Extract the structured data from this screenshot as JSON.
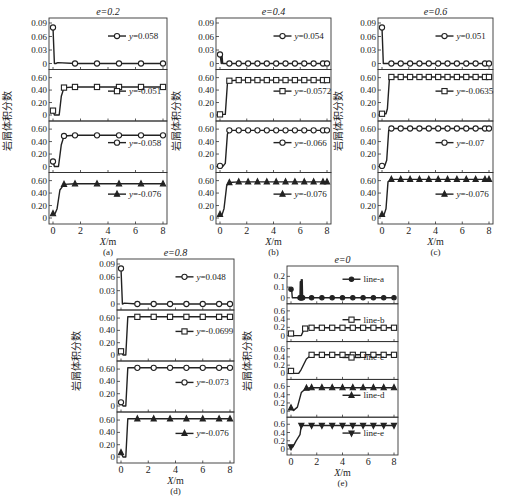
{
  "figure": {
    "ylabel": "岩屑体积分数",
    "xlabel": "X/m"
  },
  "chart_data": [
    {
      "id": "a",
      "type": "line",
      "caption": "(a)",
      "title": "e=0.2",
      "xlabel": "X/m",
      "ylabel": "岩屑体积分数",
      "xticks": [
        0,
        2,
        4,
        6,
        8
      ],
      "xlim": [
        0,
        8
      ],
      "subplots": [
        {
          "legend": "y=0.058",
          "marker": "circle",
          "yticks": [
            "0",
            "0.03",
            "0.06",
            "0.09"
          ],
          "ylim": [
            0,
            0.09
          ],
          "x": [
            0,
            0.1,
            0.2,
            0.35,
            1.6,
            3.2,
            4.8,
            6.4,
            8
          ],
          "y": [
            0.08,
            0.0,
            0.0,
            0.002,
            0.0,
            0.0,
            0.0,
            0.0,
            0.0
          ]
        },
        {
          "legend": "y=-0.051",
          "marker": "square",
          "yticks": [
            "0",
            "0.20",
            "0.40",
            "0.60"
          ],
          "ylim": [
            0,
            0.65
          ],
          "x": [
            0,
            0.1,
            0.45,
            0.6,
            0.8,
            1.6,
            3.2,
            4.8,
            6.4,
            8
          ],
          "y": [
            0.07,
            0.0,
            0.0,
            0.3,
            0.44,
            0.45,
            0.45,
            0.45,
            0.45,
            0.45
          ]
        },
        {
          "legend": "y=-0.058",
          "marker": "circle",
          "yticks": [
            "0",
            "0.20",
            "0.40",
            "0.60"
          ],
          "ylim": [
            0,
            0.65
          ],
          "x": [
            0,
            0.1,
            0.4,
            0.6,
            0.8,
            1.6,
            3.2,
            4.8,
            6.4,
            8
          ],
          "y": [
            0.08,
            0.0,
            0.0,
            0.35,
            0.49,
            0.5,
            0.5,
            0.5,
            0.5,
            0.5
          ]
        },
        {
          "legend": "y=-0.076",
          "marker": "triangle",
          "yticks": [
            "0",
            "0.20",
            "0.40",
            "0.60"
          ],
          "ylim": [
            0,
            0.65
          ],
          "x": [
            0,
            0.15,
            0.3,
            0.5,
            0.8,
            1.6,
            3.2,
            4.8,
            6.4,
            8
          ],
          "y": [
            0.07,
            0.07,
            0.15,
            0.45,
            0.54,
            0.55,
            0.55,
            0.55,
            0.55,
            0.55
          ]
        }
      ]
    },
    {
      "id": "b",
      "type": "line",
      "caption": "(b)",
      "title": "e=0.4",
      "xlabel": "X/m",
      "ylabel": "岩屑体积分数",
      "xticks": [
        0,
        2,
        4,
        6,
        8
      ],
      "xlim": [
        0,
        8
      ],
      "subplots": [
        {
          "legend": "y=0.054",
          "marker": "circle",
          "yticks": [
            "0",
            "0.03",
            "0.06",
            "0.09"
          ],
          "ylim": [
            0,
            0.09
          ],
          "x": [
            0,
            0.1,
            0.15,
            0.2,
            0.25,
            0.7,
            1.4,
            2.1,
            2.8,
            3.5,
            4.2,
            4.9,
            5.6,
            6.3,
            7,
            7.7,
            8
          ],
          "y": [
            0.02,
            0.0,
            0.018,
            0.0,
            0.0,
            0.0,
            0.0,
            0.0,
            0.0,
            0.0,
            0.0,
            0.0,
            0.0,
            0.0,
            0.0,
            0.0,
            0.0
          ]
        },
        {
          "legend": "y=-0.0572",
          "marker": "square",
          "yticks": [
            "0",
            "0.20",
            "0.40",
            "0.60"
          ],
          "ylim": [
            0,
            0.65
          ],
          "x": [
            0,
            0.4,
            0.55,
            0.7,
            1.4,
            2.1,
            2.8,
            3.5,
            4.2,
            4.9,
            5.6,
            6.3,
            7,
            7.7,
            8
          ],
          "y": [
            0.01,
            0.01,
            0.5,
            0.55,
            0.56,
            0.56,
            0.56,
            0.56,
            0.56,
            0.56,
            0.56,
            0.56,
            0.56,
            0.56,
            0.56
          ]
        },
        {
          "legend": "y=-0.066",
          "marker": "circle",
          "yticks": [
            "0",
            "0.20",
            "0.40",
            "0.60"
          ],
          "ylim": [
            0,
            0.65
          ],
          "x": [
            0,
            0.2,
            0.4,
            0.55,
            0.7,
            1.4,
            2.1,
            2.8,
            3.5,
            4.2,
            4.9,
            5.6,
            6.3,
            7,
            7.7,
            8
          ],
          "y": [
            0.01,
            0.0,
            0.05,
            0.52,
            0.58,
            0.58,
            0.58,
            0.58,
            0.58,
            0.58,
            0.58,
            0.58,
            0.58,
            0.58,
            0.58,
            0.58
          ]
        },
        {
          "legend": "y=-0.076",
          "marker": "triangle",
          "yticks": [
            "0",
            "0.20",
            "0.40",
            "0.60"
          ],
          "ylim": [
            0,
            0.65
          ],
          "x": [
            0,
            0.15,
            0.3,
            0.5,
            0.7,
            1.4,
            2.1,
            2.8,
            3.5,
            4.2,
            4.9,
            5.6,
            6.3,
            7,
            7.7,
            8
          ],
          "y": [
            0.06,
            0.05,
            0.15,
            0.52,
            0.57,
            0.58,
            0.58,
            0.58,
            0.58,
            0.58,
            0.58,
            0.58,
            0.58,
            0.58,
            0.58,
            0.58
          ]
        }
      ]
    },
    {
      "id": "c",
      "type": "line",
      "caption": "(c)",
      "title": "e=0.6",
      "xlabel": "X/m",
      "ylabel": "岩屑体积分数",
      "xticks": [
        0,
        2,
        4,
        6,
        8
      ],
      "xlim": [
        0,
        8
      ],
      "subplots": [
        {
          "legend": "y=0.051",
          "marker": "circle",
          "yticks": [
            "0",
            "0.03",
            "0.06",
            "0.09"
          ],
          "ylim": [
            0,
            0.09
          ],
          "x": [
            0,
            0.1,
            0.7,
            1.4,
            2.1,
            2.8,
            3.5,
            4.2,
            4.9,
            5.6,
            6.3,
            7,
            7.7,
            8
          ],
          "y": [
            0.08,
            0.0,
            0.0,
            0.0,
            0.0,
            0.0,
            0.0,
            0.0,
            0.0,
            0.0,
            0.0,
            0.0,
            0.0,
            0.0
          ]
        },
        {
          "legend": "y=-0.0635",
          "marker": "square",
          "yticks": [
            "0",
            "0.20",
            "0.40",
            "0.60"
          ],
          "ylim": [
            0,
            0.65
          ],
          "x": [
            0,
            0.3,
            0.4,
            0.55,
            0.7,
            1.4,
            2.1,
            2.8,
            3.5,
            4.2,
            4.9,
            5.6,
            6.3,
            7,
            7.7,
            8
          ],
          "y": [
            0.02,
            0.02,
            0.1,
            0.58,
            0.61,
            0.61,
            0.61,
            0.61,
            0.61,
            0.61,
            0.61,
            0.61,
            0.61,
            0.61,
            0.61,
            0.61
          ]
        },
        {
          "legend": "y=-0.07",
          "marker": "circle",
          "yticks": [
            "0",
            "0.20",
            "0.40",
            "0.60"
          ],
          "ylim": [
            0,
            0.65
          ],
          "x": [
            0,
            0.2,
            0.35,
            0.5,
            0.7,
            1.4,
            2.1,
            2.8,
            3.5,
            4.2,
            4.9,
            5.6,
            6.3,
            7,
            7.7,
            8
          ],
          "y": [
            0.01,
            0.01,
            0.1,
            0.58,
            0.61,
            0.61,
            0.61,
            0.61,
            0.61,
            0.61,
            0.61,
            0.61,
            0.61,
            0.61,
            0.61,
            0.61
          ]
        },
        {
          "legend": "y=-0.076",
          "marker": "triangle",
          "yticks": [
            "0",
            "0.20",
            "0.40",
            "0.60"
          ],
          "ylim": [
            0,
            0.65
          ],
          "x": [
            0,
            0.15,
            0.3,
            0.45,
            0.7,
            1.4,
            2.1,
            2.8,
            3.5,
            4.2,
            4.9,
            5.6,
            6.3,
            7,
            7.7,
            8
          ],
          "y": [
            0.06,
            0.05,
            0.15,
            0.58,
            0.62,
            0.62,
            0.62,
            0.62,
            0.62,
            0.62,
            0.62,
            0.62,
            0.62,
            0.62,
            0.62,
            0.62
          ]
        }
      ]
    },
    {
      "id": "d",
      "type": "line",
      "caption": "(d)",
      "title": "e=0.8",
      "xlabel": "X/m",
      "ylabel": "岩屑体积分数",
      "xticks": [
        0,
        2,
        4,
        6,
        8
      ],
      "xlim": [
        0,
        8
      ],
      "subplots": [
        {
          "legend": "y=0.048",
          "marker": "circle",
          "yticks": [
            "0",
            "0.03",
            "0.06",
            "0.09"
          ],
          "ylim": [
            0,
            0.09
          ],
          "x": [
            0,
            0.1,
            0.25,
            1.2,
            2.4,
            3.6,
            4.8,
            6,
            7.2,
            8
          ],
          "y": [
            0.08,
            0.0,
            0.002,
            0.0,
            0.0,
            0.0,
            0.0,
            0.0,
            0.0,
            0.0
          ]
        },
        {
          "legend": "y=-0.0699",
          "marker": "square",
          "yticks": [
            "0",
            "0.20",
            "0.40",
            "0.60"
          ],
          "ylim": [
            0,
            0.65
          ],
          "x": [
            0,
            0.15,
            0.35,
            0.5,
            1.2,
            2.4,
            3.6,
            4.8,
            6,
            7.2,
            8
          ],
          "y": [
            0.06,
            0.0,
            0.0,
            0.62,
            0.62,
            0.62,
            0.62,
            0.62,
            0.62,
            0.62,
            0.62
          ]
        },
        {
          "legend": "y=-0.073",
          "marker": "circle",
          "yticks": [
            "0",
            "0.20",
            "0.40",
            "0.60"
          ],
          "ylim": [
            0,
            0.65
          ],
          "x": [
            0,
            0.15,
            0.35,
            0.5,
            1.2,
            2.4,
            3.6,
            4.8,
            6,
            7.2,
            8
          ],
          "y": [
            0.06,
            0.0,
            0.0,
            0.62,
            0.62,
            0.62,
            0.62,
            0.62,
            0.62,
            0.62,
            0.62
          ]
        },
        {
          "legend": "y=-0.076",
          "marker": "triangle",
          "yticks": [
            "0",
            "0.20",
            "0.40",
            "0.60"
          ],
          "ylim": [
            0,
            0.65
          ],
          "x": [
            0,
            0.15,
            0.35,
            0.5,
            1.2,
            2.4,
            3.6,
            4.8,
            6,
            7.2,
            8
          ],
          "y": [
            0.07,
            0.0,
            0.0,
            0.62,
            0.62,
            0.62,
            0.62,
            0.62,
            0.62,
            0.62,
            0.62
          ]
        }
      ]
    },
    {
      "id": "e",
      "type": "line",
      "caption": "(e)",
      "title": "e=0",
      "xlabel": "X/m",
      "ylabel": "岩屑体积分数",
      "xticks": [
        0,
        2,
        4,
        6,
        8
      ],
      "xlim": [
        0,
        8
      ],
      "subplots": [
        {
          "legend": "line-a",
          "marker": "diamond",
          "yticks": [
            "0",
            "0.1",
            "0.2"
          ],
          "ylim": [
            0,
            0.25
          ],
          "x": [
            0,
            0.05,
            0.1,
            0.7,
            0.72,
            0.74,
            0.78,
            0.8,
            0.85,
            0.87,
            0.9,
            1.6,
            2.4,
            3.2,
            4,
            4.8,
            5.6,
            6.4,
            7.2,
            8
          ],
          "y": [
            0.08,
            0.08,
            0.0,
            0.0,
            0.15,
            0.0,
            0.0,
            0.17,
            0.0,
            0.17,
            0.0,
            0.0,
            0.0,
            0.0,
            0.0,
            0.0,
            0.0,
            0.0,
            0.0,
            0.0
          ]
        },
        {
          "legend": "line-b",
          "marker": "square",
          "yticks": [
            "0",
            "0.2",
            "0.4",
            "0.6"
          ],
          "ylim": [
            0,
            0.65
          ],
          "x": [
            0,
            0.2,
            0.8,
            1.0,
            1.1,
            1.6,
            2.4,
            3.2,
            4,
            4.8,
            5.6,
            6.4,
            7.2,
            8
          ],
          "y": [
            0.05,
            0.0,
            0.0,
            0.15,
            0.17,
            0.19,
            0.19,
            0.19,
            0.19,
            0.19,
            0.19,
            0.19,
            0.19,
            0.19
          ]
        },
        {
          "legend": "line-c",
          "marker": "square",
          "yticks": [
            "0",
            "0.2",
            "0.4",
            "0.6"
          ],
          "ylim": [
            0,
            0.65
          ],
          "x": [
            0,
            0.2,
            0.6,
            0.8,
            1.2,
            1.6,
            2.4,
            3.2,
            4,
            4.8,
            5.6,
            6.4,
            7.2,
            8
          ],
          "y": [
            0.06,
            0.0,
            0.0,
            0.1,
            0.35,
            0.45,
            0.45,
            0.45,
            0.45,
            0.45,
            0.45,
            0.45,
            0.45,
            0.45
          ]
        },
        {
          "legend": "line-d",
          "marker": "triangle",
          "yticks": [
            "0",
            "0.2",
            "0.4",
            "0.6"
          ],
          "ylim": [
            0,
            0.65
          ],
          "x": [
            0,
            0.2,
            0.5,
            0.8,
            1.2,
            1.6,
            2.4,
            3.2,
            4,
            4.8,
            5.6,
            6.4,
            7.2,
            8
          ],
          "y": [
            0.08,
            0.02,
            0.1,
            0.45,
            0.56,
            0.57,
            0.57,
            0.57,
            0.57,
            0.57,
            0.57,
            0.57,
            0.57,
            0.57
          ]
        },
        {
          "legend": "line-e",
          "marker": "triangle-down",
          "yticks": [
            "0",
            "0.2",
            "0.4",
            "0.6"
          ],
          "ylim": [
            0,
            0.65
          ],
          "x": [
            0,
            0.15,
            0.4,
            0.7,
            0.8,
            1.6,
            2.4,
            3.2,
            4,
            4.8,
            5.6,
            6.4,
            7.2,
            8
          ],
          "y": [
            0.05,
            0.05,
            0.2,
            0.35,
            0.57,
            0.57,
            0.57,
            0.57,
            0.57,
            0.57,
            0.57,
            0.57,
            0.57,
            0.57
          ]
        }
      ]
    }
  ]
}
